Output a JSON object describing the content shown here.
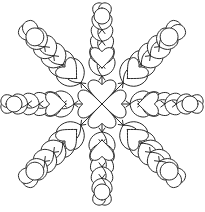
{
  "document": {
    "title": "Feathered Heart Quilting Motif",
    "type": "line-art-diagram",
    "subject": "eight-point feathered wreath quilting pattern with heart center",
    "width_px": 205,
    "height_px": 212
  },
  "style": {
    "background_color": "#ffffff",
    "line_color": "#2b2b2b",
    "fill_color": "#ffffff",
    "stroke_width_px": 1
  },
  "geometry": {
    "center_x": 102,
    "center_y": 104,
    "orthogonal_plume_length": 96,
    "diagonal_plume_length": 104,
    "plume_count": 8,
    "orthogonal_plume_feather_pairs": 6,
    "diagonal_plume_feather_pairs": 6
  },
  "center_motif": {
    "name": "four-heart pinwheel",
    "heart_count": 4,
    "heart_size": 26,
    "directions": [
      "up",
      "right",
      "down",
      "left"
    ],
    "inner_cross": true
  },
  "heart_ring": {
    "name": "surrounding heart ring",
    "heart_count": 8,
    "heart_size": 22,
    "radius": 36
  },
  "plumes": [
    {
      "id": "plume-n",
      "angle_deg": -90,
      "kind": "orthogonal",
      "label": "north"
    },
    {
      "id": "plume-ne",
      "angle_deg": -45,
      "kind": "diagonal",
      "label": "northeast"
    },
    {
      "id": "plume-e",
      "angle_deg": 0,
      "kind": "orthogonal",
      "label": "east"
    },
    {
      "id": "plume-se",
      "angle_deg": 45,
      "kind": "diagonal",
      "label": "southeast"
    },
    {
      "id": "plume-s",
      "angle_deg": 90,
      "kind": "orthogonal",
      "label": "south"
    },
    {
      "id": "plume-sw",
      "angle_deg": 135,
      "kind": "diagonal",
      "label": "southwest"
    },
    {
      "id": "plume-w",
      "angle_deg": 180,
      "kind": "orthogonal",
      "label": "west"
    },
    {
      "id": "plume-nw",
      "angle_deg": -135,
      "kind": "diagonal",
      "label": "northwest"
    }
  ]
}
